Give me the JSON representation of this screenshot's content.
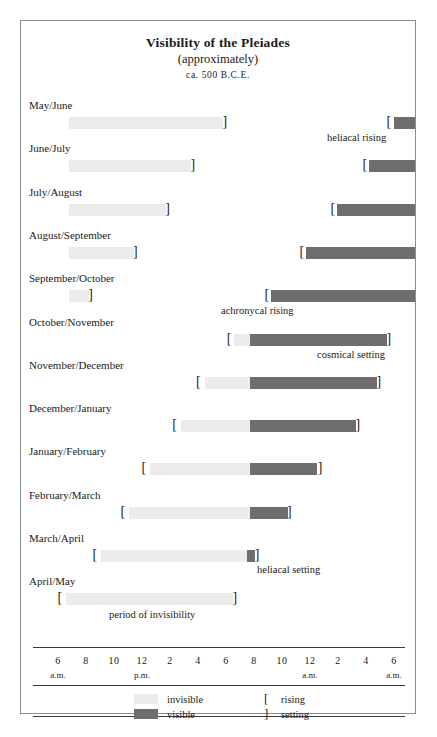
{
  "chart_data": {
    "type": "bar",
    "title": "Visibility of the Pleiades",
    "subtitle": "(approximately)",
    "date_line": "ca. 500 B.C.E.",
    "xlabel": "",
    "ylabel": "",
    "grid": false,
    "legend_position": "bottom",
    "x_axis": {
      "unit": "hour of day",
      "range_hours": [
        6,
        30
      ],
      "tick_numbers": [
        "6",
        "8",
        "10",
        "12",
        "2",
        "4",
        "6",
        "8",
        "10",
        "12",
        "2",
        "4",
        "6"
      ],
      "tick_hours": [
        6,
        8,
        10,
        12,
        14,
        16,
        18,
        20,
        22,
        24,
        26,
        28,
        30
      ],
      "period_labels": [
        {
          "text": "a.m.",
          "hour": 6
        },
        {
          "text": "p.m.",
          "hour": 12
        },
        {
          "text": "a.m.",
          "hour": 24
        },
        {
          "text": "a.m.",
          "hour": 30
        }
      ]
    },
    "categories": [
      "May/June",
      "June/July",
      "July/August",
      "August/September",
      "September/October",
      "October/November",
      "November/December",
      "December/January",
      "January/February",
      "February/March",
      "March/April",
      "April/May"
    ],
    "series": [
      {
        "name": "invisible",
        "color": "#ececec"
      },
      {
        "name": "visible",
        "color": "#6e6e6e"
      }
    ],
    "rows": [
      {
        "label": "May/June",
        "segments": [
          {
            "state": "invisible",
            "start_hour": 6.8,
            "end_hour": 17.8
          },
          {
            "state": "visible",
            "start_hour": 30.0,
            "end_hour": 31.5
          }
        ],
        "markers": [
          {
            "type": "setting",
            "glyph": "]",
            "hour": 17.9
          },
          {
            "type": "rising",
            "glyph": "[",
            "hour": 29.6
          }
        ]
      },
      {
        "label": "June/July",
        "segments": [
          {
            "state": "invisible",
            "start_hour": 6.8,
            "end_hour": 15.5
          },
          {
            "state": "visible",
            "start_hour": 28.2,
            "end_hour": 31.5
          }
        ],
        "markers": [
          {
            "type": "setting",
            "glyph": "]",
            "hour": 15.6
          },
          {
            "type": "rising",
            "glyph": "[",
            "hour": 27.9
          }
        ]
      },
      {
        "label": "July/August",
        "segments": [
          {
            "state": "invisible",
            "start_hour": 6.8,
            "end_hour": 13.7
          },
          {
            "state": "visible",
            "start_hour": 25.9,
            "end_hour": 31.5
          }
        ],
        "markers": [
          {
            "type": "setting",
            "glyph": "]",
            "hour": 13.8
          },
          {
            "type": "rising",
            "glyph": "[",
            "hour": 25.6
          }
        ]
      },
      {
        "label": "August/September",
        "segments": [
          {
            "state": "invisible",
            "start_hour": 6.8,
            "end_hour": 11.4
          },
          {
            "state": "visible",
            "start_hour": 23.7,
            "end_hour": 31.5
          }
        ],
        "markers": [
          {
            "type": "setting",
            "glyph": "]",
            "hour": 11.5
          },
          {
            "type": "rising",
            "glyph": "[",
            "hour": 23.4
          }
        ]
      },
      {
        "label": "September/October",
        "segments": [
          {
            "state": "invisible",
            "start_hour": 6.8,
            "end_hour": 8.2
          },
          {
            "state": "visible",
            "start_hour": 21.2,
            "end_hour": 31.5
          }
        ],
        "markers": [
          {
            "type": "setting",
            "glyph": "]",
            "hour": 8.3
          },
          {
            "type": "rising",
            "glyph": "[",
            "hour": 20.9
          }
        ]
      },
      {
        "label": "October/November",
        "segments": [
          {
            "state": "invisible",
            "start_hour": 18.6,
            "end_hour": 19.7
          },
          {
            "state": "visible",
            "start_hour": 19.7,
            "end_hour": 29.5
          }
        ],
        "markers": [
          {
            "type": "rising",
            "glyph": "[",
            "hour": 18.2
          },
          {
            "type": "setting",
            "glyph": "]",
            "hour": 29.6
          }
        ]
      },
      {
        "label": "November/December",
        "segments": [
          {
            "state": "invisible",
            "start_hour": 16.5,
            "end_hour": 19.7
          },
          {
            "state": "visible",
            "start_hour": 19.7,
            "end_hour": 28.8
          }
        ],
        "markers": [
          {
            "type": "rising",
            "glyph": "[",
            "hour": 16.0
          },
          {
            "type": "setting",
            "glyph": "]",
            "hour": 28.9
          }
        ]
      },
      {
        "label": "December/January",
        "segments": [
          {
            "state": "invisible",
            "start_hour": 14.8,
            "end_hour": 19.7
          },
          {
            "state": "visible",
            "start_hour": 19.7,
            "end_hour": 27.3
          }
        ],
        "markers": [
          {
            "type": "rising",
            "glyph": "[",
            "hour": 14.3
          },
          {
            "type": "setting",
            "glyph": "]",
            "hour": 27.4
          }
        ]
      },
      {
        "label": "January/February",
        "segments": [
          {
            "state": "invisible",
            "start_hour": 12.6,
            "end_hour": 19.7
          },
          {
            "state": "visible",
            "start_hour": 19.7,
            "end_hour": 24.5
          }
        ],
        "markers": [
          {
            "type": "rising",
            "glyph": "[",
            "hour": 12.1
          },
          {
            "type": "setting",
            "glyph": "]",
            "hour": 24.7
          }
        ]
      },
      {
        "label": "February/March",
        "segments": [
          {
            "state": "invisible",
            "start_hour": 11.1,
            "end_hour": 19.7
          },
          {
            "state": "visible",
            "start_hour": 19.7,
            "end_hour": 22.4
          }
        ],
        "markers": [
          {
            "type": "rising",
            "glyph": "[",
            "hour": 10.6
          },
          {
            "type": "setting",
            "glyph": "]",
            "hour": 22.5
          }
        ]
      },
      {
        "label": "March/April",
        "segments": [
          {
            "state": "invisible",
            "start_hour": 9.1,
            "end_hour": 19.5
          },
          {
            "state": "visible",
            "start_hour": 19.5,
            "end_hour": 20.1
          }
        ],
        "markers": [
          {
            "type": "rising",
            "glyph": "[",
            "hour": 8.6
          },
          {
            "type": "setting",
            "glyph": "]",
            "hour": 20.2
          }
        ]
      },
      {
        "label": "April/May",
        "segments": [
          {
            "state": "invisible",
            "start_hour": 6.6,
            "end_hour": 18.5
          }
        ],
        "markers": [
          {
            "type": "rising",
            "glyph": "[",
            "hour": 6.1
          },
          {
            "type": "setting",
            "glyph": "]",
            "hour": 18.6
          }
        ]
      }
    ],
    "annotations": [
      {
        "text": "heliacal rising",
        "row": 0,
        "align": "right"
      },
      {
        "text": "achronycal rising",
        "row": 4,
        "align": "center"
      },
      {
        "text": "cosmical setting",
        "row": 5,
        "align": "right"
      },
      {
        "text": "heliacal setting",
        "row": 10,
        "align": "center"
      },
      {
        "text": "period of invisibility",
        "row": 11,
        "align": "center"
      }
    ],
    "legend": {
      "invisible_label": "invisible",
      "visible_label": "visible",
      "rising_label": "rising",
      "setting_label": "setting",
      "rising_glyph": "[",
      "setting_glyph": "]",
      "invisible_color": "#ececec",
      "visible_color": "#6e6e6e"
    }
  }
}
